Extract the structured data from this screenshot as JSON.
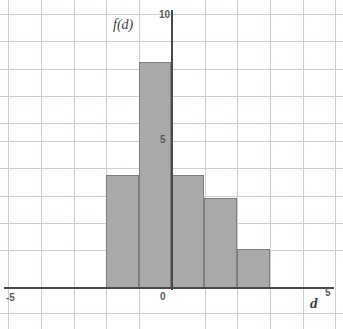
{
  "chart_data": {
    "type": "bar",
    "title": "",
    "subtitle": "",
    "xlabel": "d",
    "ylabel": "f(d)",
    "xlim": [
      -5,
      5
    ],
    "ylim": [
      0,
      10
    ],
    "grid": true,
    "legend": false,
    "x_ticks": [
      "-5",
      "0",
      "5"
    ],
    "x_tick_values": [
      -5,
      0,
      5
    ],
    "y_ticks": [
      "5",
      "10"
    ],
    "y_tick_values": [
      5,
      10
    ],
    "bar_color": "#a9a9a9",
    "bar_edge_color": "#7d7d7d",
    "grid_color": "#c9cfdb",
    "axis_color": "#4a4a4a",
    "bar_width": 1,
    "categories": [
      "-1.5",
      "-0.5",
      "0.5",
      "1.5",
      "2.5"
    ],
    "bin_edges": [
      -2,
      -1,
      0,
      1,
      2,
      3
    ],
    "values": [
      4,
      8,
      4,
      3.2,
      1.4
    ],
    "bars": [
      {
        "name": "bar-1",
        "x_start": -2,
        "x_end": -1,
        "value": 4
      },
      {
        "name": "bar-2",
        "x_start": -1,
        "x_end": 0,
        "value": 8
      },
      {
        "name": "bar-3",
        "x_start": 0,
        "x_end": 1,
        "value": 4
      },
      {
        "name": "bar-4",
        "x_start": 1,
        "x_end": 2,
        "value": 3.2
      },
      {
        "name": "bar-5",
        "x_start": 2,
        "x_end": 3,
        "value": 1.4
      }
    ]
  },
  "labels": {
    "y_axis_title": "f(d)",
    "x_axis_title": "d",
    "y_top": "10",
    "y_mid": "5",
    "x_left": "-5",
    "x_origin": "0",
    "x_right": "5"
  }
}
